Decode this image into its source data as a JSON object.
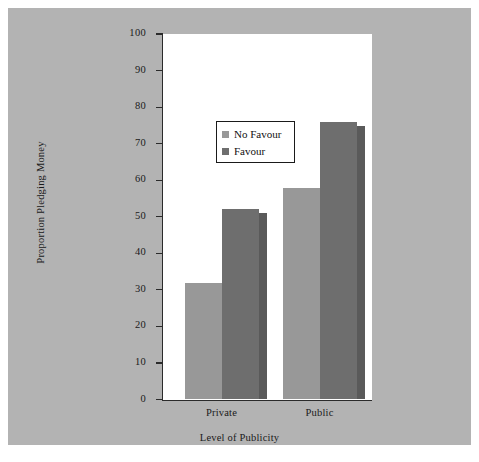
{
  "chart_data": {
    "type": "bar",
    "title": "",
    "xlabel": "Level of Publicity",
    "ylabel": "Proportion Pledging Money",
    "categories": [
      "Private",
      "Public"
    ],
    "series": [
      {
        "name": "No Favour",
        "values": [
          31.8,
          58.0
        ],
        "color": "#989898"
      },
      {
        "name": "Favour",
        "values": [
          52.0,
          76.0
        ],
        "color": "#6e6e6e"
      }
    ],
    "ylim": [
      0,
      100
    ],
    "yticks": [
      0,
      10,
      20,
      30,
      40,
      50,
      60,
      70,
      80,
      90,
      100
    ],
    "ytick_labels": [
      "0",
      "10",
      "20",
      "30",
      "40",
      "50",
      "60",
      "70",
      "80",
      "90",
      "100"
    ],
    "grid": false,
    "legend_position": "upper center",
    "legend_entries": [
      "No Favour",
      "Favour"
    ],
    "background_color": "#b3b3b3",
    "plot_background_color": "#ffffff",
    "axis_color": "#2b2b2b"
  }
}
